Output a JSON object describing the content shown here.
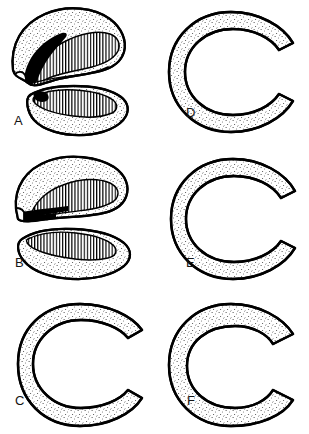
{
  "figure": {
    "background_color": "#ffffff",
    "ink_color": "#000000",
    "stipple_color": "#3a3a3a",
    "hatch_color": "#000000",
    "panel_count": 6,
    "columns": 2,
    "rows": 3
  },
  "panels": [
    {
      "id": "a",
      "label": "A",
      "column": 1,
      "row": 1,
      "description": "Two separated crescent fragments, upper and lower, with vertical hatched inner surface and solid black tear wedge at the left anterior horn",
      "fragments": 2,
      "has_black_region": true,
      "hatch": "vertical"
    },
    {
      "id": "b",
      "label": "B",
      "column": 1,
      "row": 2,
      "description": "Two separated crescent fragments with vertical hatching; narrow black flap projecting at the left margin",
      "fragments": 2,
      "has_black_region": true,
      "hatch": "vertical"
    },
    {
      "id": "c",
      "label": "C",
      "column": 1,
      "row": 3,
      "description": "Single C-shaped ring with a branching black tear tracking through the vertically hatched inner zone",
      "fragments": 1,
      "has_black_region": true,
      "hatch": "vertical"
    },
    {
      "id": "d",
      "label": "D",
      "column": 2,
      "row": 1,
      "description": "Single C-shaped ring with a jagged black tear forming a displaced inner flap over vertical hatching",
      "fragments": 1,
      "has_black_region": true,
      "hatch": "vertical"
    },
    {
      "id": "e",
      "label": "E",
      "column": 2,
      "row": 2,
      "description": "Single C-shaped ring with a horizontal black tear splitting the vertically hatched inner zone",
      "fragments": 1,
      "has_black_region": true,
      "hatch": "vertical"
    },
    {
      "id": "f",
      "label": "F",
      "column": 2,
      "row": 3,
      "description": "Single C-shaped ring with a small central vertically hatched block crossed by two black tear bands",
      "fragments": 1,
      "has_black_region": true,
      "hatch": "vertical"
    }
  ]
}
